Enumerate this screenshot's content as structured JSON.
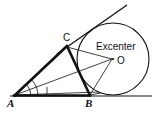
{
  "figure": {
    "kind": "geometry-diagram",
    "background_color": "#ffffff",
    "stroke_color": "#111111",
    "labels": {
      "vertex_a": "A",
      "vertex_b": "B",
      "vertex_c": "C",
      "center_point": "O",
      "annotation": "Excenter"
    },
    "points": {
      "A": {
        "x": 14,
        "y": 96
      },
      "B": {
        "x": 90,
        "y": 96
      },
      "C": {
        "x": 67,
        "y": 46
      },
      "O": {
        "x": 113,
        "y": 59
      }
    },
    "excircle": {
      "cx": 113,
      "cy": 59,
      "r": 36
    },
    "baseline": {
      "x1": 10,
      "y1": 96,
      "x2": 152,
      "y2": 96
    },
    "tangent_line": {
      "x1": 57,
      "y1": 54,
      "x2": 126,
      "y2": 6
    },
    "triangle_sides": [
      {
        "name": "AB",
        "x1": 14,
        "y1": 96,
        "x2": 90,
        "y2": 96,
        "weight": "thick"
      },
      {
        "name": "AC",
        "x1": 14,
        "y1": 96,
        "x2": 67,
        "y2": 46,
        "weight": "thick"
      },
      {
        "name": "CB",
        "x1": 67,
        "y1": 46,
        "x2": 90,
        "y2": 96,
        "weight": "thick"
      }
    ],
    "bisectors": [
      {
        "name": "A-to-O",
        "x1": 14,
        "y1": 96,
        "x2": 113,
        "y2": 59,
        "weight": "thin"
      },
      {
        "name": "C-to-O",
        "x1": 67,
        "y1": 46,
        "x2": 113,
        "y2": 59,
        "weight": "thin"
      },
      {
        "name": "B-to-O",
        "x1": 90,
        "y1": 96,
        "x2": 113,
        "y2": 59,
        "weight": "thin"
      },
      {
        "name": "A-lower-ray",
        "x1": 14,
        "y1": 96,
        "x2": 95,
        "y2": 93,
        "weight": "thin"
      }
    ],
    "angle_marks": {
      "arc_inner_radius": 17,
      "arc_outer_radius": 24,
      "tick_x": 47,
      "tick_y_top": 86,
      "tick_y_bottom": 96
    }
  }
}
